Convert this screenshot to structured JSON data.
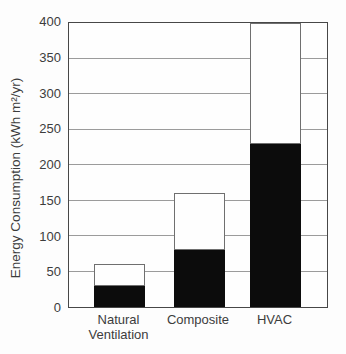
{
  "chart_data": {
    "type": "bar",
    "stacked": true,
    "title": "",
    "xlabel": "",
    "ylabel": "Energy Consumption (kWh m²/yr)",
    "categories": [
      "Natural Ventilation",
      "Composite",
      "HVAC"
    ],
    "category_label_lines": [
      [
        "Natural",
        "Ventilation"
      ],
      [
        "Composite"
      ],
      [
        "HVAC"
      ]
    ],
    "series": [
      {
        "name": "black-bottom-segment",
        "color": "#0c0c0c",
        "values": [
          30,
          80,
          230
        ]
      },
      {
        "name": "white-top-segment",
        "color": "#fefefe",
        "values": [
          30,
          80,
          170
        ]
      }
    ],
    "totals": [
      60,
      160,
      400
    ],
    "ylim": [
      0,
      400
    ],
    "yticks": [
      0,
      50,
      100,
      150,
      200,
      250,
      300,
      350,
      400
    ],
    "grid": "horizontal",
    "legend": "none",
    "colors": {
      "grid": "#9b9b9b",
      "axis_border": "#474747",
      "bar_fill_black": "#0c0c0c",
      "bar_outline_white_segment": "#6f6f6f",
      "text": "#3c3c3c",
      "background": "#fdfdfd"
    }
  }
}
